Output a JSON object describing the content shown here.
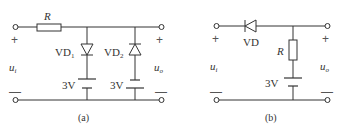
{
  "figure": {
    "circuit_a": {
      "caption": "(a)",
      "resistor_label": "R",
      "diode1_label": "VD",
      "diode1_sub": "1",
      "diode2_label": "VD",
      "diode2_sub": "2",
      "battery1_label": "3V",
      "battery2_label": "3V",
      "input_label": "u",
      "input_sub": "i",
      "output_label": "u",
      "output_sub": "o",
      "plus": "+",
      "minus": "—"
    },
    "circuit_b": {
      "caption": "(b)",
      "diode_label": "VD",
      "resistor_label": "R",
      "battery_label": "3V",
      "input_label": "u",
      "input_sub": "i",
      "output_label": "u",
      "output_sub": "o",
      "plus": "+",
      "minus": "—"
    }
  }
}
